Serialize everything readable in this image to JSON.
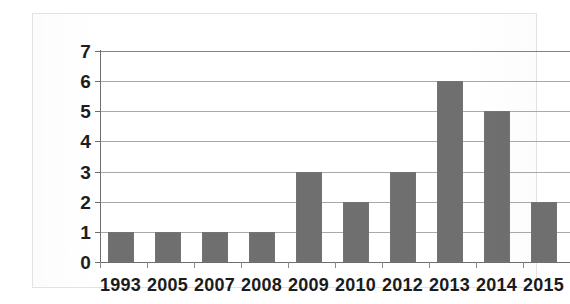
{
  "chart_data": {
    "type": "bar",
    "title": "",
    "subtitle": "",
    "xlabel": "",
    "ylabel": "",
    "categories": [
      "1993",
      "2005",
      "2007",
      "2008",
      "2009",
      "2010",
      "2012",
      "2013",
      "2014",
      "2015"
    ],
    "values": [
      1,
      1,
      1,
      1,
      3,
      2,
      3,
      6,
      5,
      2
    ],
    "ylim": [
      0,
      7
    ],
    "y_ticks": [
      "0",
      "1",
      "2",
      "3",
      "4",
      "5",
      "6",
      "7"
    ],
    "y_tick_values": [
      0,
      1,
      2,
      3,
      4,
      5,
      6,
      7
    ],
    "grid": true,
    "grid_orientation": "horizontal",
    "legend": false,
    "legend_position": "none",
    "bar_color": "#6f6f6f",
    "grid_color": "#9a9a9a",
    "axis_color": "#6d6d6d",
    "label_color": "#1b1b1b",
    "background_color": "#ffffff",
    "frame_color": "#e2e2e2"
  }
}
